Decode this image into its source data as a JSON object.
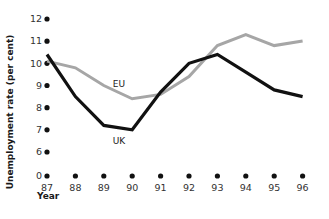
{
  "chart_data": {
    "type": "line",
    "title": "",
    "xlabel": "Year",
    "ylabel": "Unemployment rate (per cent)",
    "categories": [
      "87",
      "88",
      "89",
      "90",
      "91",
      "92",
      "93",
      "94",
      "95",
      "96"
    ],
    "y_ticks": [
      "0",
      "6",
      "7",
      "8",
      "9",
      "10",
      "11",
      "12"
    ],
    "y_axis_break": "0 to 6",
    "ylim": [
      6,
      12
    ],
    "grid": false,
    "legend": "inline labels",
    "series": [
      {
        "name": "EU",
        "color": "#a6a6a6",
        "values": [
          10.1,
          9.8,
          9.0,
          8.4,
          8.6,
          9.4,
          10.8,
          11.3,
          10.8,
          11.0
        ]
      },
      {
        "name": "UK",
        "color": "#111111",
        "values": [
          10.4,
          8.5,
          7.2,
          7.0,
          8.7,
          10.0,
          10.4,
          9.6,
          8.8,
          8.5
        ]
      }
    ]
  }
}
